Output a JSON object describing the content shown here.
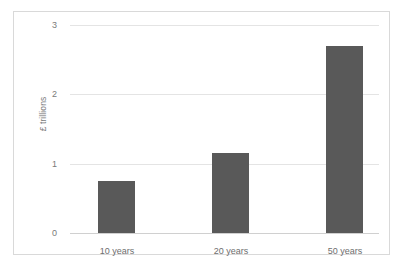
{
  "chart_data": {
    "type": "bar",
    "title": "",
    "subtitle": "",
    "xlabel": "",
    "ylabel": "£ trillions",
    "categories": [
      "10 years",
      "20 years",
      "50 years"
    ],
    "values": [
      0.75,
      1.15,
      2.7
    ],
    "series": [
      {
        "name": "",
        "values": [
          0.75,
          1.15,
          2.7
        ]
      }
    ],
    "ylim": [
      0,
      3
    ],
    "yticks": [
      0,
      1,
      2,
      3
    ],
    "ytick_labels": [
      "0",
      "1",
      "2",
      "3"
    ],
    "grid": true,
    "legend": false,
    "legend_position": "none",
    "bar_color": "#595959",
    "gridline_color": "#e4e4e4",
    "border_color": "#d9d9d9",
    "background_color": "#ffffff",
    "axis_text_color": "#7a7a7a"
  }
}
